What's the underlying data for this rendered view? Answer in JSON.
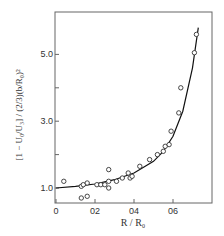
{
  "chart_data": {
    "type": "scatter",
    "title": "",
    "xlabel": "R / R₀",
    "ylabel": "[1 − U₀/U₃] / (2/3)(b/R₀)²",
    "xlim": [
      0,
      0.8
    ],
    "ylim": [
      0.6,
      6.1
    ],
    "x_ticks": [
      0,
      0.2,
      0.4,
      0.6
    ],
    "x_tick_labels": [
      "0",
      "02",
      "04",
      "06"
    ],
    "y_ticks": [
      1.0,
      2.0,
      3.0,
      4.0,
      5.0
    ],
    "y_tick_labels": [
      "1.0",
      "",
      "3.0",
      "",
      "5.0"
    ],
    "grid": false,
    "legend": null,
    "series": [
      {
        "name": "measurements",
        "marker": "open-circle",
        "x": [
          0.04,
          0.13,
          0.14,
          0.16,
          0.13,
          0.16,
          0.21,
          0.23,
          0.25,
          0.27,
          0.27,
          0.27,
          0.31,
          0.34,
          0.37,
          0.38,
          0.39,
          0.43,
          0.48,
          0.52,
          0.55,
          0.56,
          0.58,
          0.59,
          0.63,
          0.64,
          0.71,
          0.72
        ],
        "y": [
          1.2,
          1.05,
          1.1,
          1.15,
          0.7,
          0.75,
          1.1,
          1.1,
          1.1,
          1.2,
          1.55,
          1.0,
          1.2,
          1.3,
          1.45,
          1.3,
          1.35,
          1.65,
          1.85,
          2.0,
          2.1,
          2.25,
          2.3,
          2.7,
          3.25,
          4.0,
          5.05,
          5.6
        ]
      },
      {
        "name": "theory curve",
        "marker": "line",
        "x": [
          0.0,
          0.1,
          0.2,
          0.3,
          0.4,
          0.5,
          0.55,
          0.6,
          0.65,
          0.7,
          0.73
        ],
        "y": [
          1.0,
          1.05,
          1.12,
          1.25,
          1.45,
          1.8,
          2.1,
          2.55,
          3.3,
          4.6,
          5.8
        ]
      }
    ]
  }
}
